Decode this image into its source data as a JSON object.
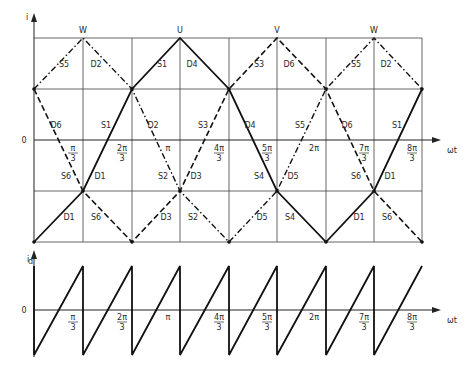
{
  "diagram": {
    "upper_plot": {
      "y_axis_label": "i",
      "x_axis_label": "ωt",
      "origin_label": "0",
      "phase_labels": [
        {
          "name": "W",
          "x": 83
        },
        {
          "name": "U",
          "x": 180
        },
        {
          "name": "V",
          "x": 277
        },
        {
          "name": "W",
          "x": 374
        }
      ],
      "tick_labels": [
        {
          "num": "π",
          "den": "3",
          "x": 83
        },
        {
          "num": "2π",
          "den": "3",
          "x": 132
        },
        {
          "num": "π",
          "den": "",
          "x": 180
        },
        {
          "num": "4π",
          "den": "3",
          "x": 229
        },
        {
          "num": "5π",
          "den": "3",
          "x": 277
        },
        {
          "num": "2π",
          "den": "",
          "x": 326
        },
        {
          "num": "7π",
          "den": "3",
          "x": 374
        },
        {
          "num": "8π",
          "den": "3",
          "x": 422
        }
      ],
      "device_labels": [
        {
          "t": "S5",
          "x": 64,
          "y": 67
        },
        {
          "t": "D2",
          "x": 96,
          "y": 67
        },
        {
          "t": "S1",
          "x": 162,
          "y": 67
        },
        {
          "t": "D4",
          "x": 192,
          "y": 67
        },
        {
          "t": "S3",
          "x": 259,
          "y": 67
        },
        {
          "t": "D6",
          "x": 289,
          "y": 67
        },
        {
          "t": "S5",
          "x": 356,
          "y": 67
        },
        {
          "t": "D2",
          "x": 386,
          "y": 67
        },
        {
          "t": "D6",
          "x": 56,
          "y": 128
        },
        {
          "t": "S1",
          "x": 106,
          "y": 128
        },
        {
          "t": "D2",
          "x": 153,
          "y": 128
        },
        {
          "t": "S3",
          "x": 203,
          "y": 128
        },
        {
          "t": "D4",
          "x": 250,
          "y": 128
        },
        {
          "t": "S5",
          "x": 300,
          "y": 128
        },
        {
          "t": "D6",
          "x": 347,
          "y": 128
        },
        {
          "t": "S1",
          "x": 397,
          "y": 128
        },
        {
          "t": "S6",
          "x": 66,
          "y": 179
        },
        {
          "t": "D1",
          "x": 100,
          "y": 179
        },
        {
          "t": "S2",
          "x": 163,
          "y": 179
        },
        {
          "t": "D3",
          "x": 196,
          "y": 179
        },
        {
          "t": "S4",
          "x": 259,
          "y": 179
        },
        {
          "t": "D5",
          "x": 293,
          "y": 179
        },
        {
          "t": "S6",
          "x": 356,
          "y": 179
        },
        {
          "t": "D1",
          "x": 390,
          "y": 179
        },
        {
          "t": "D1",
          "x": 69,
          "y": 220
        },
        {
          "t": "S6",
          "x": 96,
          "y": 220
        },
        {
          "t": "D3",
          "x": 166,
          "y": 220
        },
        {
          "t": "S2",
          "x": 193,
          "y": 220
        },
        {
          "t": "D5",
          "x": 262,
          "y": 220
        },
        {
          "t": "S4",
          "x": 290,
          "y": 220
        },
        {
          "t": "D1",
          "x": 359,
          "y": 220
        },
        {
          "t": "S6",
          "x": 387,
          "y": 220
        }
      ],
      "series": [
        {
          "name": "U",
          "style": "solid",
          "points": [
            [
              34,
              242
            ],
            [
              83,
              191
            ],
            [
              132,
              89
            ],
            [
              180,
              38
            ],
            [
              229,
              89
            ],
            [
              277,
              191
            ],
            [
              326,
              242
            ],
            [
              374,
              191
            ],
            [
              422,
              89
            ]
          ]
        },
        {
          "name": "V",
          "style": "dashed",
          "points": [
            [
              34,
              89
            ],
            [
              83,
              191
            ],
            [
              132,
              242
            ],
            [
              180,
              191
            ],
            [
              229,
              89
            ],
            [
              277,
              38
            ],
            [
              326,
              89
            ],
            [
              374,
              191
            ],
            [
              422,
              242
            ]
          ]
        },
        {
          "name": "W",
          "style": "dash-dot",
          "points": [
            [
              34,
              89
            ],
            [
              83,
              38
            ],
            [
              132,
              89
            ],
            [
              180,
              191
            ],
            [
              229,
              242
            ],
            [
              277,
              191
            ],
            [
              326,
              89
            ],
            [
              374,
              38
            ],
            [
              422,
              89
            ]
          ]
        }
      ]
    },
    "lower_plot": {
      "y_axis_label": "i",
      "y_axis_subscript": "d",
      "x_axis_label": "ωt",
      "origin_label": "0",
      "tick_labels": [
        {
          "num": "π",
          "den": "3",
          "x": 83
        },
        {
          "num": "2π",
          "den": "3",
          "x": 132
        },
        {
          "num": "π",
          "den": "",
          "x": 180
        },
        {
          "num": "4π",
          "den": "3",
          "x": 229
        },
        {
          "num": "5π",
          "den": "3",
          "x": 277
        },
        {
          "num": "2π",
          "den": "",
          "x": 326
        },
        {
          "num": "7π",
          "den": "3",
          "x": 374
        },
        {
          "num": "8π",
          "den": "3",
          "x": 422
        }
      ],
      "waveform": "sawtooth"
    }
  }
}
